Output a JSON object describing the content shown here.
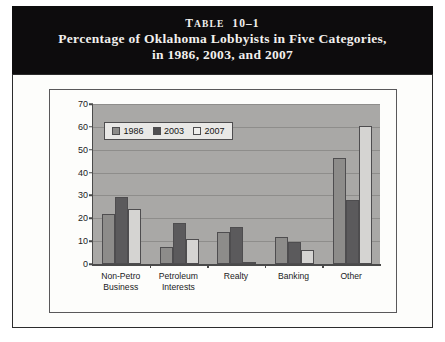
{
  "banner": {
    "table_number_prefix": "T",
    "table_number_rest": "ABLE",
    "table_number": "10–1",
    "line2": "Percentage of Oklahoma Lobbyists in Five Categories,",
    "line3": "in 1986, 2003, and 2007"
  },
  "colors": {
    "banner_bg": "#0d0c0d",
    "plot_bg": "#a9a8a6",
    "series_1986": "#8d8c8a",
    "series_2003": "#5b5a5c",
    "series_2007": "#d5d4d2",
    "axis": "#4a4a4a",
    "gridline": "#8e8d8b",
    "frame_border": "#2c2c2c"
  },
  "chart_data": {
    "type": "bar",
    "title": "Percentage of Oklahoma Lobbyists in Five Categories, in 1986, 2003, and 2007",
    "xlabel": "",
    "ylabel": "",
    "ylim": [
      0,
      70
    ],
    "yticks": [
      0,
      10,
      20,
      30,
      40,
      50,
      60,
      70
    ],
    "ytick_labels": [
      "0",
      "10",
      "20",
      "30",
      "40",
      "50",
      "60",
      "70"
    ],
    "grid": true,
    "legend_position": "top-left-inside",
    "categories": [
      "Non-Petro\nBusiness",
      "Petroleum\nInterests",
      "Realty",
      "Banking",
      "Other"
    ],
    "category_labels_flat": [
      "Non-Petro Business",
      "Petroleum Interests",
      "Realty",
      "Banking",
      "Other"
    ],
    "series": [
      {
        "name": "1986",
        "color": "#8d8c8a",
        "values": [
          22,
          7.5,
          14,
          12,
          46.5
        ]
      },
      {
        "name": "2003",
        "color": "#5b5a5c",
        "values": [
          29.5,
          18,
          16,
          9.5,
          28
        ]
      },
      {
        "name": "2007",
        "color": "#d5d4d2",
        "values": [
          24,
          11,
          1,
          6,
          60.5
        ]
      }
    ]
  }
}
